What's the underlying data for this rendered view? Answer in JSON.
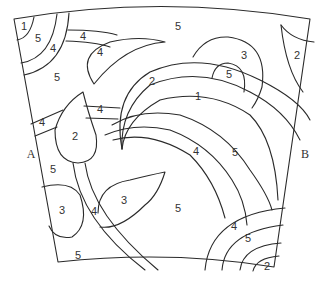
{
  "diagram": {
    "side_labels": [
      {
        "id": "A",
        "text": "A",
        "x": 31,
        "y": 155
      },
      {
        "id": "B",
        "text": "B",
        "x": 305,
        "y": 155
      }
    ],
    "regions": [
      {
        "text": "1",
        "x": 24,
        "y": 27
      },
      {
        "text": "5",
        "x": 38,
        "y": 39
      },
      {
        "text": "4",
        "x": 53,
        "y": 49
      },
      {
        "text": "4",
        "x": 83,
        "y": 37
      },
      {
        "text": "4",
        "x": 100,
        "y": 53
      },
      {
        "text": "5",
        "x": 57,
        "y": 78
      },
      {
        "text": "5",
        "x": 178,
        "y": 27
      },
      {
        "text": "3",
        "x": 244,
        "y": 56
      },
      {
        "text": "5",
        "x": 229,
        "y": 75
      },
      {
        "text": "2",
        "x": 297,
        "y": 56
      },
      {
        "text": "2",
        "x": 152,
        "y": 82
      },
      {
        "text": "1",
        "x": 198,
        "y": 97
      },
      {
        "text": "4",
        "x": 100,
        "y": 110
      },
      {
        "text": "4",
        "x": 42,
        "y": 123
      },
      {
        "text": "2",
        "x": 75,
        "y": 137
      },
      {
        "text": "4",
        "x": 196,
        "y": 152
      },
      {
        "text": "5",
        "x": 235,
        "y": 153
      },
      {
        "text": "5",
        "x": 53,
        "y": 170
      },
      {
        "text": "3",
        "x": 124,
        "y": 201
      },
      {
        "text": "3",
        "x": 62,
        "y": 211
      },
      {
        "text": "4",
        "x": 94,
        "y": 212
      },
      {
        "text": "5",
        "x": 178,
        "y": 209
      },
      {
        "text": "4",
        "x": 234,
        "y": 227
      },
      {
        "text": "5",
        "x": 248,
        "y": 239
      },
      {
        "text": "5",
        "x": 78,
        "y": 256
      },
      {
        "text": "2",
        "x": 267,
        "y": 267
      }
    ],
    "line_color": "#2a2a2a",
    "background": "#ffffff"
  }
}
